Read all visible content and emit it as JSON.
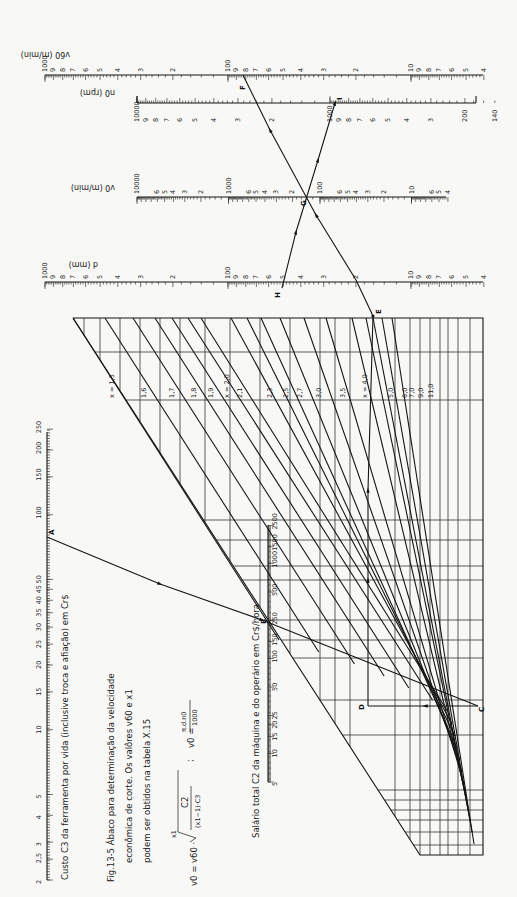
{
  "figure": {
    "caption_line1": "Fig.13-5  Ábaco para determinação da velocidade",
    "caption_line2": "econômica de corte. Os valôres v60 e x1",
    "caption_line3": "podem ser obtidos na tabela  X.15",
    "formula_left": "v0 = v60 · ⁿ√( C2 / ((x1−1)·C3) )",
    "formula_root_index": "x1",
    "formula_lhs": "v0 = v60 ·",
    "formula_num": "C2",
    "formula_den": "(x1−1)·C3",
    "formula_sep": ";",
    "formula_right_lhs": "v0 =",
    "formula_right_num": "π.d.n0",
    "formula_right_den": "1000"
  },
  "scales": {
    "v60": {
      "title": "v60 (m/min)",
      "ticks": [
        "1000",
        "9",
        "8",
        "7",
        "6",
        "5",
        "4",
        "3",
        "2",
        "100",
        "9",
        "8",
        "7",
        "6",
        "5",
        "4",
        "3",
        "2",
        "10",
        "9",
        "8",
        "7",
        "6",
        "5",
        "4"
      ]
    },
    "n0": {
      "title": "n0 (rpm)",
      "ticks": [
        "10000",
        "9",
        "8",
        "7",
        "6",
        "5",
        "4",
        "3",
        "2",
        "1000",
        "9",
        "8",
        "7",
        "6",
        "5",
        "4",
        "3",
        "200",
        "140"
      ]
    },
    "v0": {
      "title": "v0 (m/min)",
      "ticks": [
        "10000",
        "6",
        "5",
        "4",
        "3",
        "2",
        "1000",
        "6",
        "5",
        "4",
        "3",
        "2",
        "100",
        "6",
        "5",
        "4",
        "3",
        "2",
        "10",
        "6",
        "5",
        "4"
      ]
    },
    "d": {
      "title": "d (mm)",
      "ticks": [
        "1000",
        "9",
        "8",
        "7",
        "6",
        "5",
        "4",
        "3",
        "2",
        "100",
        "9",
        "8",
        "7",
        "6",
        "5",
        "4",
        "3",
        "2",
        "10",
        "9",
        "8",
        "7",
        "6",
        "5",
        "4"
      ]
    },
    "C3": {
      "title": "Custo C3 da ferramenta por vida  (inclusive troca  e afiação)   em   Cr$",
      "ticks": [
        "2",
        "2,5",
        "3",
        "4",
        "5",
        "10",
        "15",
        "20",
        "25",
        "30",
        "35",
        "40",
        "45",
        "50",
        "100",
        "150",
        "200",
        "250"
      ]
    },
    "C2": {
      "title": "Salário total C2 da máquina e do operário em   Cr$/hora",
      "ticks": [
        "5",
        "10",
        "15",
        "20",
        "25",
        "50",
        "100",
        "150",
        "250",
        "500",
        "1000",
        "1500",
        "2500"
      ]
    }
  },
  "x_curves": [
    "x = 1,5",
    "1,6",
    "1,7",
    "1,8",
    "1,9",
    "x = 2,0",
    "2,1",
    "2,3",
    "2,5",
    "2,7",
    "3,0",
    "3,5",
    "x = 4,0",
    "5,0",
    "6,0",
    "7,0",
    "9,0",
    "11,0"
  ],
  "points": {
    "A": "A",
    "B": "B",
    "C": "C",
    "D": "D",
    "E": "E",
    "F": "F",
    "G": "G",
    "H": "H",
    "I": "I"
  }
}
